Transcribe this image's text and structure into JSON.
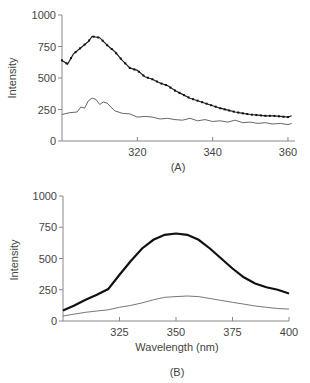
{
  "chart_data": [
    {
      "panel": "(A)",
      "type": "line",
      "title": "",
      "xlabel": "",
      "ylabel": "Intensity",
      "xlim": [
        300,
        362
      ],
      "ylim": [
        0,
        1000
      ],
      "xticks": [
        320,
        340,
        360
      ],
      "yticks": [
        0,
        250,
        500,
        750,
        1000
      ],
      "grid": false,
      "series": [
        {
          "name": "dotted (upper)",
          "style": "line-with-markers",
          "x": [
            300,
            301.5,
            303,
            305,
            307,
            308,
            310,
            312,
            314,
            316,
            318,
            320,
            322,
            324,
            326,
            328,
            330,
            332,
            334,
            336,
            338,
            340,
            342,
            344,
            346,
            348,
            350,
            352,
            354,
            356,
            358,
            360,
            361
          ],
          "y": [
            640,
            610,
            690,
            740,
            790,
            830,
            820,
            760,
            710,
            640,
            580,
            560,
            510,
            490,
            460,
            440,
            400,
            370,
            340,
            320,
            300,
            280,
            260,
            245,
            230,
            220,
            210,
            205,
            200,
            200,
            195,
            190,
            200
          ]
        },
        {
          "name": "solid (lower)",
          "style": "line",
          "x": [
            300,
            302,
            304,
            305,
            306,
            307,
            308,
            309,
            310,
            311,
            312,
            314,
            316,
            318,
            320,
            322,
            324,
            326,
            328,
            330,
            332,
            334,
            336,
            338,
            340,
            342,
            344,
            346,
            348,
            350,
            352,
            354,
            356,
            358,
            360,
            361
          ],
          "y": [
            210,
            225,
            230,
            270,
            260,
            320,
            340,
            330,
            290,
            310,
            300,
            240,
            220,
            215,
            190,
            195,
            190,
            175,
            180,
            170,
            165,
            180,
            160,
            170,
            155,
            160,
            150,
            165,
            145,
            150,
            140,
            145,
            135,
            140,
            130,
            140
          ]
        }
      ]
    },
    {
      "panel": "(B)",
      "type": "line",
      "title": "",
      "xlabel": "Wavelength (nm)",
      "ylabel": "Intensity",
      "xlim": [
        300,
        400
      ],
      "ylim": [
        0,
        1000
      ],
      "xticks": [
        325,
        350,
        375,
        400
      ],
      "yticks": [
        0,
        250,
        500,
        750,
        1000
      ],
      "grid": false,
      "series": [
        {
          "name": "bold (upper)",
          "style": "thick-line",
          "x": [
            300,
            305,
            310,
            315,
            320,
            325,
            330,
            335,
            340,
            345,
            350,
            355,
            360,
            365,
            370,
            375,
            380,
            385,
            390,
            395,
            400
          ],
          "y": [
            85,
            125,
            170,
            210,
            255,
            370,
            480,
            580,
            650,
            690,
            700,
            690,
            650,
            580,
            500,
            420,
            350,
            300,
            270,
            250,
            220
          ]
        },
        {
          "name": "thin (lower)",
          "style": "line",
          "x": [
            300,
            305,
            310,
            315,
            320,
            325,
            330,
            335,
            340,
            345,
            350,
            355,
            360,
            365,
            370,
            375,
            380,
            385,
            390,
            395,
            400
          ],
          "y": [
            40,
            55,
            70,
            80,
            90,
            110,
            125,
            145,
            170,
            190,
            195,
            200,
            195,
            180,
            165,
            150,
            135,
            120,
            110,
            100,
            95
          ]
        }
      ]
    }
  ],
  "labels": {
    "panel_a": "(A)",
    "panel_b": "(B)",
    "ylabel": "Intensity",
    "xlabel_b": "Wavelength (nm)"
  }
}
